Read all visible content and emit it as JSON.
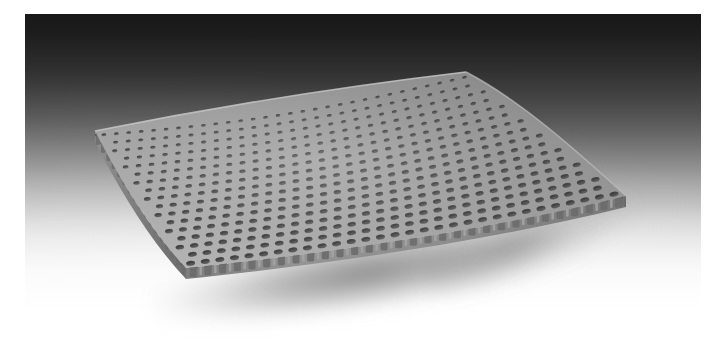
{
  "image": {
    "kind": "product-photograph",
    "subject": "perforated sheet",
    "subject_description": "A gently curved rectangular perforated panel with a staggered pattern of round holes, shown in three-quarter perspective on a graduated studio backdrop.",
    "orientation": "three-quarter perspective, raised far-right corner",
    "has_visible_text": false,
    "caption": ""
  },
  "backdrop": {
    "name": "graduated studio sweep",
    "top_color": "#181818",
    "mid_color": "#8b8b8b",
    "bottom_color": "#ffffff",
    "direction": "vertical dark-to-light"
  },
  "photo_margin": {
    "color": "#ffffff",
    "left_px": 25,
    "top_px": 14,
    "right_px": 5,
    "bottom_px": 0
  },
  "shadow": {
    "name": "soft cast shadow",
    "color": "#3c3c3c",
    "opacity": 0.5,
    "blur_px": 7
  },
  "sheet": {
    "name": "perforated panel",
    "face_color": "#9a9a9a",
    "face_highlight_color": "#b8b8b8",
    "face_shade_color": "#7e7e7e",
    "hole_color": "#4a4a4a",
    "hole_shadow_color": "#3a3a3a",
    "edge_color": "#8e8e8e",
    "edge_dark_color": "#6b6b6b",
    "edge_darkest_color": "#555555",
    "thickness_px": 11,
    "hole_shape": "round",
    "hole_layout": "staggered / offset rows",
    "hole_columns": 30,
    "hole_rows": 17,
    "edge_profile": "scalloped (half-holes open at the cut edge)",
    "corners": {
      "left": [
        95,
        131
      ],
      "top": [
        466,
        72
      ],
      "right": [
        626,
        196
      ],
      "front": [
        186,
        268
      ]
    }
  },
  "palette": {
    "white": "#ffffff",
    "near_black": "#181818",
    "mid_gray": "#8b8b8b",
    "sheet_gray": "#9a9a9a",
    "hole_gray": "#4a4a4a"
  }
}
